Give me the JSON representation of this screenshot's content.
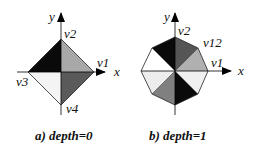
{
  "figure": {
    "panel_a": {
      "caption": "a) depth=0",
      "axis_x_label": "x",
      "axis_y_label": "y",
      "vertices": [
        "v1",
        "v2",
        "v3",
        "v4"
      ],
      "faces": [
        {
          "quadrant": "upper-right",
          "color": "#a8a8a8"
        },
        {
          "quadrant": "upper-left",
          "color": "#0a0a0a"
        },
        {
          "quadrant": "lower-left",
          "color": "#f4f4f4"
        },
        {
          "quadrant": "lower-right",
          "color": "#5a5a5a"
        }
      ]
    },
    "panel_b": {
      "caption": "b) depth=1",
      "axis_x_label": "x",
      "axis_y_label": "y",
      "vertices": [
        "v1",
        "v2",
        "v12"
      ],
      "faces": [
        {
          "sector": "0-45",
          "color": "#b0b0b0"
        },
        {
          "sector": "45-90",
          "color": "#555555"
        },
        {
          "sector": "90-135",
          "color": "#0a0a0a"
        },
        {
          "sector": "135-180",
          "color": "#ffffff"
        },
        {
          "sector": "180-225",
          "color": "#ededed"
        },
        {
          "sector": "225-270",
          "color": "#808080"
        },
        {
          "sector": "270-315",
          "color": "#0a0a0a"
        },
        {
          "sector": "315-360",
          "color": "#f0f0f0"
        }
      ]
    }
  }
}
